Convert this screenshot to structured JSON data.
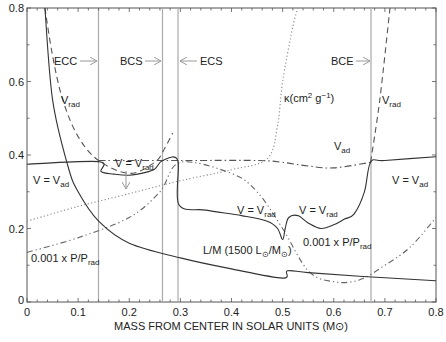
{
  "chart_data": {
    "type": "line",
    "title": "",
    "xlabel": "MASS FROM CENTER IN SOLAR UNITS (M⊙)",
    "ylabel": "",
    "xlim": [
      0,
      0.8
    ],
    "ylim": [
      0,
      0.8
    ],
    "x_ticks": [
      "0",
      "0.1",
      "0.2",
      "0.3",
      "0.4",
      "0.5",
      "0.6",
      "0.7",
      "0.8"
    ],
    "y_ticks": [
      "0",
      "0.2",
      "0.4",
      "0.6",
      "0.8"
    ],
    "grid": false,
    "legend": "none (curves labeled inline)",
    "boundaries": [
      {
        "x": 0.14,
        "label": "ECC",
        "arrow": "right"
      },
      {
        "x": 0.265,
        "label": "BCS",
        "arrow": "right"
      },
      {
        "x": 0.295,
        "label": "ECS",
        "arrow": "left"
      },
      {
        "x": 0.672,
        "label": "BCE",
        "arrow": "right"
      }
    ],
    "series": [
      {
        "name": "V (actual gradient)",
        "style": "solid",
        "points": [
          [
            0,
            0.375
          ],
          [
            0.14,
            0.382
          ],
          [
            0.145,
            0.355
          ],
          [
            0.17,
            0.348
          ],
          [
            0.2,
            0.345
          ],
          [
            0.23,
            0.352
          ],
          [
            0.25,
            0.362
          ],
          [
            0.265,
            0.385
          ],
          [
            0.295,
            0.385
          ],
          [
            0.297,
            0.265
          ],
          [
            0.35,
            0.25
          ],
          [
            0.42,
            0.235
          ],
          [
            0.47,
            0.22
          ],
          [
            0.49,
            0.2
          ],
          [
            0.5,
            0.17
          ],
          [
            0.505,
            0.2
          ],
          [
            0.512,
            0.23
          ],
          [
            0.53,
            0.235
          ],
          [
            0.55,
            0.215
          ],
          [
            0.575,
            0.2
          ],
          [
            0.6,
            0.21
          ],
          [
            0.62,
            0.225
          ],
          [
            0.64,
            0.24
          ],
          [
            0.66,
            0.3
          ],
          [
            0.672,
            0.38
          ],
          [
            0.7,
            0.385
          ],
          [
            0.8,
            0.395
          ]
        ]
      },
      {
        "name": "V_rad",
        "style": "dashed",
        "points": [
          [
            0.035,
            0.8
          ],
          [
            0.05,
            0.67
          ],
          [
            0.07,
            0.55
          ],
          [
            0.1,
            0.45
          ],
          [
            0.14,
            0.385
          ],
          [
            0.2,
            0.35
          ],
          [
            0.25,
            0.38
          ],
          [
            0.27,
            0.42
          ],
          [
            0.285,
            0.46
          ]
        ],
        "points_2": [
          [
            0.672,
            0.38
          ],
          [
            0.69,
            0.55
          ],
          [
            0.71,
            0.8
          ]
        ]
      },
      {
        "name": "V_ad",
        "style": "dash-dot",
        "points": [
          [
            0.14,
            0.385
          ],
          [
            0.3,
            0.385
          ],
          [
            0.45,
            0.385
          ],
          [
            0.5,
            0.38
          ],
          [
            0.55,
            0.37
          ],
          [
            0.6,
            0.365
          ],
          [
            0.672,
            0.38
          ]
        ]
      },
      {
        "name": "kappa (cm^2 g^-1)",
        "style": "dotted",
        "points": [
          [
            0,
            0.22
          ],
          [
            0.1,
            0.26
          ],
          [
            0.2,
            0.295
          ],
          [
            0.3,
            0.33
          ],
          [
            0.4,
            0.36
          ],
          [
            0.47,
            0.39
          ],
          [
            0.49,
            0.48
          ],
          [
            0.5,
            0.6
          ],
          [
            0.52,
            0.75
          ],
          [
            0.53,
            0.8
          ]
        ]
      },
      {
        "name": "0.001 x P/P_rad",
        "style": "dash-dot-dot",
        "points": [
          [
            0,
            0.135
          ],
          [
            0.1,
            0.175
          ],
          [
            0.2,
            0.23
          ],
          [
            0.26,
            0.3
          ],
          [
            0.3,
            0.38
          ],
          [
            0.4,
            0.35
          ],
          [
            0.45,
            0.3
          ],
          [
            0.5,
            0.2
          ],
          [
            0.55,
            0.085
          ],
          [
            0.6,
            0.055
          ],
          [
            0.65,
            0.06
          ],
          [
            0.7,
            0.1
          ],
          [
            0.75,
            0.15
          ],
          [
            0.8,
            0.23
          ]
        ]
      },
      {
        "name": "L/M (1500 L⊙/M⊙)",
        "style": "solid",
        "points": [
          [
            0.035,
            0.8
          ],
          [
            0.05,
            0.55
          ],
          [
            0.08,
            0.37
          ],
          [
            0.1,
            0.3
          ],
          [
            0.14,
            0.22
          ],
          [
            0.2,
            0.16
          ],
          [
            0.3,
            0.12
          ],
          [
            0.4,
            0.09
          ],
          [
            0.5,
            0.065
          ],
          [
            0.51,
            0.085
          ],
          [
            0.55,
            0.08
          ],
          [
            0.65,
            0.07
          ],
          [
            0.8,
            0.058
          ]
        ]
      }
    ],
    "annotations": [
      {
        "text": "ECC",
        "x": 0.05,
        "y": 0.66
      },
      {
        "text": "BCS",
        "x": 0.17,
        "y": 0.66
      },
      {
        "text": "ECS",
        "x": 0.33,
        "y": 0.66
      },
      {
        "text": "BCE",
        "x": 0.6,
        "y": 0.66
      },
      {
        "text": "V_rad",
        "x": 0.07,
        "y": 0.58
      },
      {
        "text": "V_rad",
        "x": 0.69,
        "y": 0.55
      },
      {
        "text": "V = V_rad",
        "x": 0.19,
        "y": 0.41
      },
      {
        "text": "V = V_ad",
        "x": 0.02,
        "y": 0.33
      },
      {
        "text": "V = V_ad",
        "x": 0.72,
        "y": 0.33
      },
      {
        "text": "V_ad",
        "x": 0.6,
        "y": 0.42
      },
      {
        "text": "kappa(cm^2 g^-1)",
        "x": 0.42,
        "y": 0.54
      },
      {
        "text": "V = V_rad",
        "x": 0.42,
        "y": 0.23
      },
      {
        "text": "V = V_rad",
        "x": 0.53,
        "y": 0.23
      },
      {
        "text": "0.001 x P/P_rad",
        "x": 0.56,
        "y": 0.15
      },
      {
        "text": "L/M (1500 L⊙/M⊙)",
        "x": 0.38,
        "y": 0.135
      },
      {
        "text": "0.001 x P/P_rad",
        "x": 0.02,
        "y": 0.12
      }
    ]
  },
  "labels": {
    "x_axis": "MASS FROM CENTER IN SOLAR UNITS (M⊙)",
    "ecc": "ECC",
    "bcs": "BCS",
    "ecs": "ECS",
    "bce": "BCE",
    "vrad_left": "V",
    "vrad_right": "V",
    "rad_sub": "rad",
    "ad_sub": "ad",
    "v_eq": "V = V",
    "vad_label": "V",
    "kappa": "κ(cm",
    "kappa_sup2": "2",
    "kappa_g": " g",
    "kappa_supm1": "−1",
    "kappa_close": ")",
    "pprad_prefix": "0.001 x P/P",
    "lm_prefix": "L/M (1500 L",
    "lm_mid": "/M",
    "lm_close": ")",
    "sun": "⊙"
  },
  "ticks": {
    "x": [
      "0",
      "0.1",
      "0.2",
      "0.3",
      "0.4",
      "0.5",
      "0.6",
      "0.7",
      "0.8"
    ],
    "y": [
      "0",
      "0.2",
      "0.4",
      "0.6",
      "0.8"
    ]
  }
}
